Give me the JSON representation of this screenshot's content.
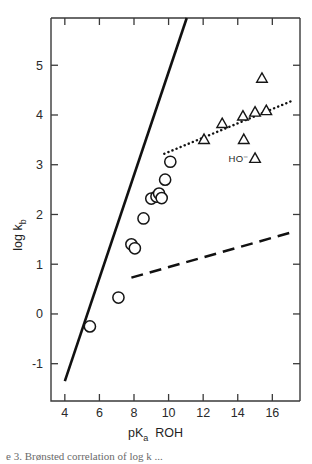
{
  "figure": {
    "background_color": "#ffffff",
    "ink_color": "#111111",
    "caption_fragment": "e 3. Brønsted correlation of log k ..."
  },
  "chart_data": {
    "type": "scatter",
    "title": "",
    "xlabel": "pK",
    "xlabel_sub": "a",
    "xlabel_suffix": "ROH",
    "ylabel": "log k",
    "ylabel_sub": "b",
    "xlim": [
      3.2,
      17.6
    ],
    "ylim": [
      -1.75,
      5.95
    ],
    "xticks": [
      4,
      6,
      8,
      10,
      12,
      14,
      16
    ],
    "xticklabels": [
      "4",
      "6",
      "8",
      "10",
      "12",
      "14",
      "16"
    ],
    "yticks": [
      -1,
      0,
      1,
      2,
      3,
      4,
      5
    ],
    "yticklabels": [
      "-1",
      "0",
      "1",
      "2",
      "3",
      "4",
      "5"
    ],
    "grid": false,
    "legend": "none",
    "annotations": [
      {
        "text": "HO⁻",
        "x": 14.05,
        "y": 3.12,
        "name": "hydroxide-label"
      }
    ],
    "series": [
      {
        "name": "alkoxide-circles",
        "marker": "circle",
        "points": [
          {
            "x": 5.45,
            "y": -0.25
          },
          {
            "x": 7.1,
            "y": 0.33
          },
          {
            "x": 7.85,
            "y": 1.4
          },
          {
            "x": 8.05,
            "y": 1.32
          },
          {
            "x": 8.55,
            "y": 1.92
          },
          {
            "x": 9.0,
            "y": 2.32
          },
          {
            "x": 9.3,
            "y": 2.36
          },
          {
            "x": 9.45,
            "y": 2.42
          },
          {
            "x": 9.6,
            "y": 2.33
          },
          {
            "x": 9.8,
            "y": 2.7
          },
          {
            "x": 10.1,
            "y": 3.06
          }
        ]
      },
      {
        "name": "oxyanion-triangles",
        "marker": "triangle",
        "points": [
          {
            "x": 12.05,
            "y": 3.5
          },
          {
            "x": 13.1,
            "y": 3.82
          },
          {
            "x": 14.3,
            "y": 3.97
          },
          {
            "x": 15.0,
            "y": 4.05
          },
          {
            "x": 15.65,
            "y": 4.08
          },
          {
            "x": 15.4,
            "y": 4.73
          },
          {
            "x": 14.35,
            "y": 3.5
          },
          {
            "x": 15.0,
            "y": 3.12
          }
        ]
      }
    ],
    "lines": [
      {
        "name": "bronsted-solid-line",
        "style": "solid",
        "slope_note": "steep primary correlation",
        "from": {
          "x": 4.0,
          "y": -1.35
        },
        "to": {
          "x": 11.05,
          "y": 5.95
        }
      },
      {
        "name": "bronsted-dotted-line",
        "style": "dotted",
        "from": {
          "x": 9.75,
          "y": 3.22
        },
        "to": {
          "x": 17.25,
          "y": 4.3
        }
      },
      {
        "name": "bronsted-dashed-line",
        "style": "dashed",
        "from": {
          "x": 7.85,
          "y": 0.73
        },
        "to": {
          "x": 17.0,
          "y": 1.63
        }
      }
    ]
  }
}
